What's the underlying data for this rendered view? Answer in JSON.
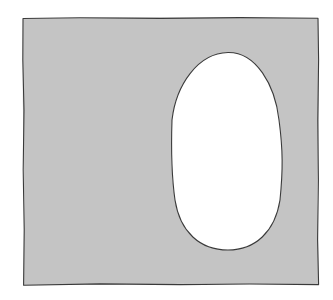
{
  "diagram": {
    "square": {
      "fill": "#c4c4c4",
      "stroke": "#3a3a3a",
      "x": 23,
      "y": 18,
      "width": 295,
      "height": 267
    },
    "hole": {
      "shape": "oval",
      "fill": "#ffffff",
      "stroke": "#3a3a3a",
      "cx": 227,
      "cy": 151,
      "rx": 56,
      "ry": 99
    }
  }
}
